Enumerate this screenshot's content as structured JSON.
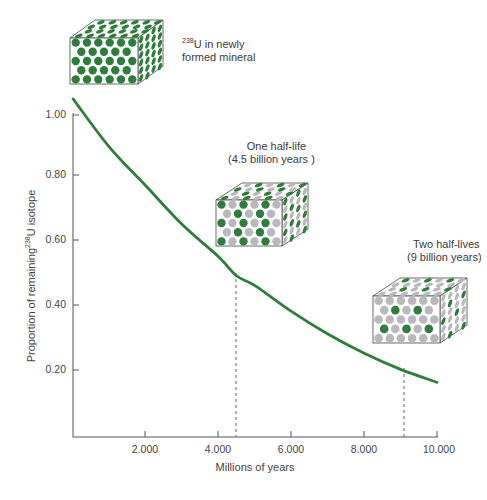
{
  "chart_data": {
    "type": "line",
    "title": "",
    "xlabel": "Millions of years",
    "ylabel_prefix": "Proportion of remaining",
    "ylabel_isotope_mass": "238",
    "ylabel_suffix": "U isotope",
    "x_ticks": [
      "2.000",
      "4.000",
      "6.000",
      "8.000",
      "10.000"
    ],
    "y_ticks": [
      "1.00",
      "0.80",
      "0.60",
      "0.40",
      "0.20"
    ],
    "xlim": [
      0,
      10000
    ],
    "ylim": [
      0,
      1.05
    ],
    "grid": false,
    "series": [
      {
        "name": "238U decay curve",
        "color": "#2e7d3a",
        "x": [
          0,
          1000,
          2000,
          3000,
          4000,
          4500,
          5000,
          6000,
          7000,
          8000,
          9000,
          10000
        ],
        "values": [
          1.05,
          0.9,
          0.78,
          0.66,
          0.56,
          0.5,
          0.47,
          0.39,
          0.32,
          0.26,
          0.21,
          0.17
        ]
      }
    ],
    "reference_lines": [
      {
        "x": 4500,
        "style": "dashed",
        "label": "One half-life"
      },
      {
        "x": 9000,
        "style": "dashed",
        "label": "Two half-lives"
      }
    ]
  },
  "annotations": {
    "fresh": {
      "mass": "238",
      "line1": "U in newly",
      "line2": "formed mineral"
    },
    "one_half_life": {
      "line1": "One half-life",
      "line2": "(4.5 billion years  )"
    },
    "two_half_lives": {
      "line1": "Two half-lives",
      "line2": "(9 billion years)"
    }
  },
  "colors": {
    "uranium": "#2e7d3a",
    "lead": "#b9b9bd",
    "axis": "#555555"
  }
}
